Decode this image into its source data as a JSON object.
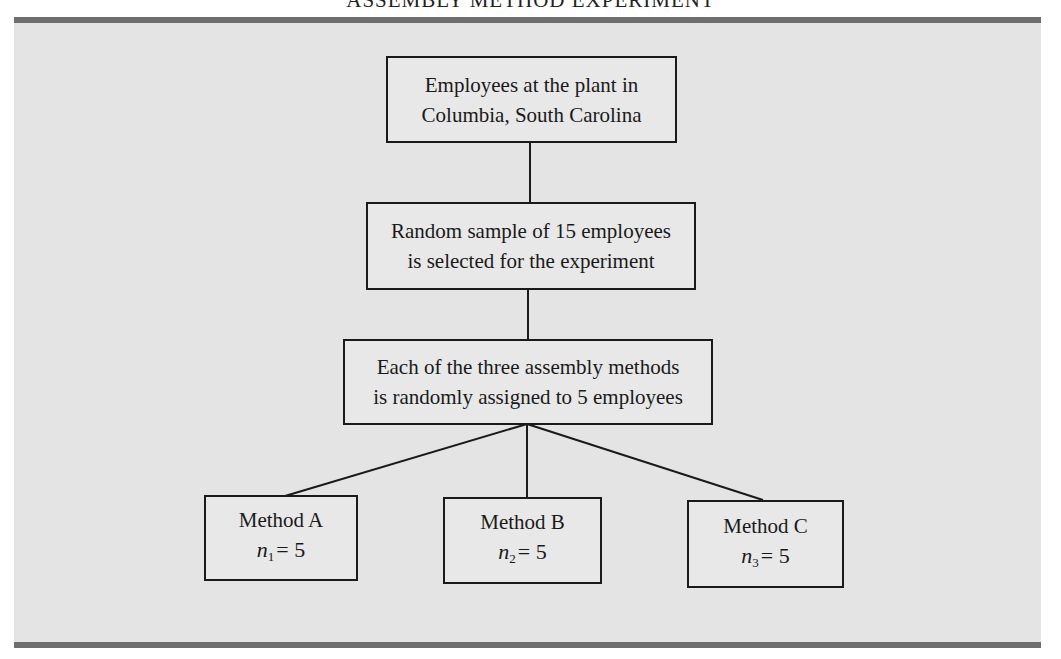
{
  "title": "ASSEMBLY METHOD EXPERIMENT",
  "colors": {
    "panel_background": "#e4e4e4",
    "rule": "#6e6e6e",
    "box_border": "#1a1a1a",
    "text": "#1a1a1a"
  },
  "nodes": {
    "population": {
      "lines": [
        "Employees at the plant in",
        "Columbia, South Carolina"
      ]
    },
    "sample": {
      "lines": [
        "Random sample of 15 employees",
        "is selected for the experiment"
      ]
    },
    "assignment": {
      "lines": [
        "Each of the three assembly methods",
        "is randomly assigned to 5 employees"
      ]
    },
    "methods": [
      {
        "label": "Method A",
        "n_symbol": "n",
        "n_subscript": "1",
        "n_value": "= 5"
      },
      {
        "label": "Method B",
        "n_symbol": "n",
        "n_subscript": "2",
        "n_value": "= 5"
      },
      {
        "label": "Method C",
        "n_symbol": "n",
        "n_subscript": "3",
        "n_value": "= 5"
      }
    ]
  },
  "edges": [
    [
      "population",
      "sample"
    ],
    [
      "sample",
      "assignment"
    ],
    [
      "assignment",
      "methods.0"
    ],
    [
      "assignment",
      "methods.1"
    ],
    [
      "assignment",
      "methods.2"
    ]
  ]
}
